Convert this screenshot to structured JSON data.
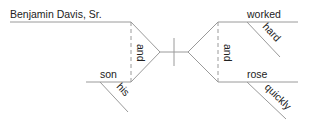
{
  "diagram": {
    "type": "sentence-diagram",
    "subjects": {
      "top": "Benjamin Davis, Sr.",
      "bottom": "son",
      "bottom_modifier": "his",
      "conjunction": "and"
    },
    "predicates": {
      "top": "worked",
      "top_modifier": "hard",
      "bottom": "rose",
      "bottom_modifier": "quickly",
      "conjunction": "and"
    },
    "line_color": "#9a9a9a",
    "text_color": "#222222"
  }
}
